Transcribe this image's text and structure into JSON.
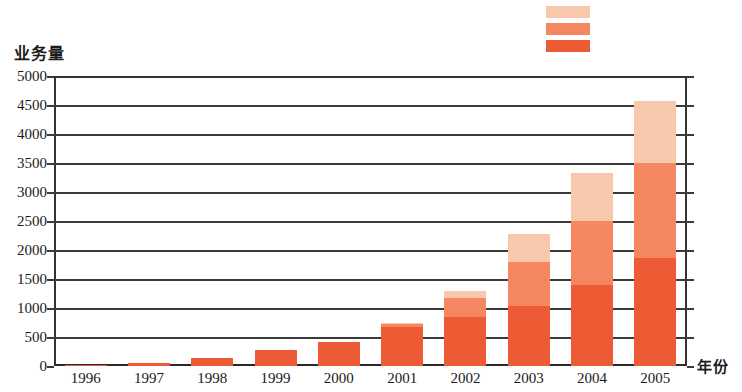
{
  "chart_data": {
    "type": "bar",
    "subtype": "stacked",
    "title": "",
    "xlabel": "年份",
    "ylabel": "业务量",
    "categories": [
      "1996",
      "1997",
      "1998",
      "1999",
      "2000",
      "2001",
      "2002",
      "2003",
      "2004",
      "2005"
    ],
    "ylim": [
      0,
      5000
    ],
    "ytick_labels": [
      "0",
      "500",
      "1000",
      "1500",
      "2000",
      "2500",
      "3000",
      "3500",
      "4000",
      "4500",
      "5000"
    ],
    "ytick_values": [
      0,
      500,
      1000,
      1500,
      2000,
      2500,
      3000,
      3500,
      4000,
      4500,
      5000
    ],
    "grid": true,
    "legend_position": "top-right",
    "series": [
      {
        "name": "series-1",
        "color": "#ED5B34",
        "values": [
          20,
          60,
          130,
          270,
          410,
          670,
          850,
          1030,
          1400,
          1860
        ]
      },
      {
        "name": "series-2",
        "color": "#F4875F",
        "values": [
          0,
          0,
          0,
          0,
          0,
          60,
          330,
          770,
          1100,
          1640
        ]
      },
      {
        "name": "series-3",
        "color": "#F8C8AC",
        "values": [
          0,
          0,
          0,
          0,
          0,
          10,
          110,
          480,
          830,
          1070
        ]
      }
    ],
    "totals": [
      20,
      60,
      130,
      270,
      410,
      740,
      1290,
      2280,
      3330,
      4570
    ]
  },
  "legend": {
    "items": [
      {
        "name": "legend-swatch-light",
        "color": "#F8C8AC",
        "label": ""
      },
      {
        "name": "legend-swatch-medium",
        "color": "#F4875F",
        "label": ""
      },
      {
        "name": "legend-swatch-dark",
        "color": "#ED5B34",
        "label": ""
      }
    ]
  },
  "colors": {
    "dark": "#ED5B34",
    "medium": "#F4875F",
    "light": "#F8C8AC",
    "axis": "#333333",
    "text": "#1a1a1a",
    "background": "#ffffff"
  }
}
